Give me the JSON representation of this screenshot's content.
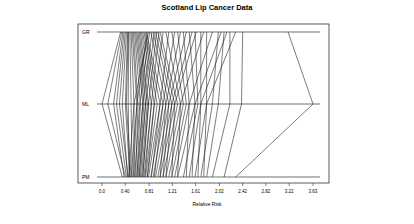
{
  "chart_data": {
    "type": "line",
    "title": "Scotland Lip Cancer Data",
    "xlabel": "Relative Risk",
    "ylabel": "",
    "axes": [
      "GR",
      "ML",
      "PM"
    ],
    "xlim": [
      0.0,
      3.63
    ],
    "x_ticks": [
      "0.0",
      "0.40",
      "0.81",
      "1.21",
      "1.61",
      "2.02",
      "2.42",
      "2.82",
      "3.22",
      "3.63"
    ],
    "x_tick_values": [
      0.0,
      0.4,
      0.81,
      1.21,
      1.61,
      2.02,
      2.42,
      2.82,
      3.22,
      3.63
    ],
    "grid": false,
    "legend": null,
    "series_description": "Each line connects a region's relative risk estimate on GR, ML and PM axes",
    "lines": [
      [
        0.32,
        0.0,
        0.35
      ],
      [
        0.34,
        0.1,
        0.4
      ],
      [
        0.36,
        0.2,
        0.38
      ],
      [
        0.38,
        0.25,
        0.42
      ],
      [
        0.4,
        0.3,
        0.45
      ],
      [
        0.42,
        0.35,
        0.44
      ],
      [
        0.44,
        0.4,
        0.48
      ],
      [
        0.45,
        0.42,
        0.5
      ],
      [
        0.46,
        0.45,
        0.47
      ],
      [
        0.48,
        0.5,
        0.52
      ],
      [
        0.5,
        0.55,
        0.55
      ],
      [
        0.52,
        0.6,
        0.54
      ],
      [
        0.54,
        0.62,
        0.58
      ],
      [
        0.56,
        0.66,
        0.6
      ],
      [
        0.58,
        0.7,
        0.62
      ],
      [
        0.6,
        0.72,
        0.64
      ],
      [
        0.62,
        0.75,
        0.66
      ],
      [
        0.64,
        0.78,
        0.68
      ],
      [
        0.66,
        0.8,
        0.7
      ],
      [
        0.68,
        0.85,
        0.72
      ],
      [
        0.7,
        0.9,
        0.75
      ],
      [
        0.72,
        0.95,
        0.78
      ],
      [
        0.74,
        1.0,
        0.8
      ],
      [
        0.76,
        1.05,
        0.84
      ],
      [
        0.78,
        0.6,
        0.5
      ],
      [
        0.8,
        0.55,
        0.46
      ],
      [
        0.82,
        0.65,
        0.56
      ],
      [
        0.84,
        1.1,
        0.88
      ],
      [
        0.86,
        0.7,
        0.6
      ],
      [
        0.88,
        1.15,
        0.92
      ],
      [
        0.9,
        0.75,
        0.64
      ],
      [
        0.92,
        1.2,
        0.96
      ],
      [
        0.94,
        0.8,
        0.7
      ],
      [
        0.96,
        1.25,
        1.0
      ],
      [
        0.98,
        0.85,
        0.74
      ],
      [
        1.0,
        1.3,
        1.05
      ],
      [
        1.05,
        0.9,
        0.78
      ],
      [
        1.1,
        1.35,
        1.1
      ],
      [
        1.15,
        1.0,
        0.85
      ],
      [
        1.2,
        1.4,
        1.15
      ],
      [
        1.25,
        1.05,
        0.9
      ],
      [
        1.3,
        1.45,
        1.2
      ],
      [
        1.35,
        1.1,
        1.0
      ],
      [
        1.4,
        1.5,
        1.25
      ],
      [
        1.45,
        1.15,
        1.05
      ],
      [
        1.5,
        1.6,
        1.3
      ],
      [
        1.55,
        1.2,
        1.1
      ],
      [
        1.6,
        1.65,
        1.4
      ],
      [
        1.62,
        1.25,
        1.2
      ],
      [
        1.7,
        1.7,
        1.5
      ],
      [
        1.75,
        1.35,
        1.3
      ],
      [
        1.8,
        1.8,
        1.6
      ],
      [
        1.9,
        1.5,
        1.45
      ],
      [
        2.0,
        1.9,
        1.7
      ],
      [
        2.05,
        1.6,
        1.55
      ],
      [
        2.1,
        2.0,
        1.8
      ],
      [
        2.15,
        1.7,
        1.65
      ],
      [
        2.2,
        2.2,
        1.9
      ],
      [
        2.3,
        1.8,
        1.75
      ],
      [
        2.42,
        2.4,
        2.1
      ],
      [
        3.2,
        3.63,
        2.3
      ]
    ]
  },
  "background_text": [
    "distribution of the parameters of interest",
    "Consider the",
    "tion of a predictive distribution",
    "of prior distributions",
    "which can be seen in Figure",
    "the estimates",
    "for the second set"
  ]
}
